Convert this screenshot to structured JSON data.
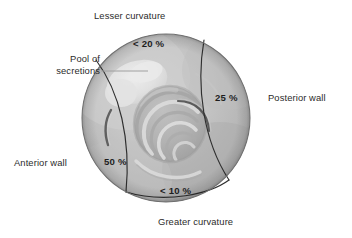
{
  "figure": {
    "width": 352,
    "height": 238,
    "background": "#ffffff"
  },
  "colors": {
    "background": "#ffffff",
    "text": "#2b2b2b",
    "percent_text": "#1d1d1d",
    "wall_fill": "#bcbcbc",
    "wall_fill_light": "#c9c9c9",
    "lumen_fill": "#b0b0b0",
    "secretion_pool": "#e2e2e2",
    "division_line": "#2f2f2f",
    "fold_dark": "#4a4a4a",
    "fold_light": "#dcdcdc",
    "leader_line": "#9a9a9a",
    "outline": "#6e6e6e"
  },
  "labels": {
    "lesser_curvature": "Lesser curvature",
    "greater_curvature": "Greater curvature",
    "posterior_wall": "Posterior wall",
    "anterior_wall": "Anterior wall",
    "pool_of_secretions": "Pool of\nsecretions",
    "pool_of_secretions_line1": "Pool of",
    "pool_of_secretions_line2": "secretions"
  },
  "regions": [
    {
      "id": "lesser-curvature",
      "name": "Lesser curvature",
      "percent_label": "< 20 %",
      "value": 20,
      "comparator": "less-than"
    },
    {
      "id": "posterior-wall",
      "name": "Posterior wall",
      "percent_label": "25 %",
      "value": 25,
      "comparator": "exact"
    },
    {
      "id": "anterior-wall",
      "name": "Anterior wall",
      "percent_label": "50 %",
      "value": 50,
      "comparator": "exact"
    },
    {
      "id": "greater-curvature",
      "name": "Greater curvature",
      "percent_label": "< 10 %",
      "value": 10,
      "comparator": "less-than"
    }
  ],
  "annotations": {
    "pool_leader_line": "leader-line from 'Pool of secretions' text to the pale blob inside the upper-left of the stomach lumen"
  }
}
